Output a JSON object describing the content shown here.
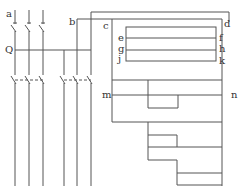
{
  "diagram": {
    "type": "electrical-switching-schematic",
    "line_color": "#555555",
    "background": "#ffffff",
    "labels": {
      "a": "a",
      "b": "b",
      "c": "c",
      "d": "d",
      "e": "e",
      "f": "f",
      "g": "g",
      "h": "h",
      "j": "j",
      "k": "k",
      "m": "m",
      "n": "n",
      "q": "Q"
    },
    "components": {
      "top_switches": 3,
      "bottom_switches": 6,
      "bus_bars_left": 3,
      "bus_bars_right": 3,
      "inner_panel_rows": 3
    }
  }
}
